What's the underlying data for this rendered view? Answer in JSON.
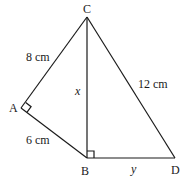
{
  "diagram": {
    "points": {
      "A": {
        "label": "A",
        "x": 21,
        "y": 108
      },
      "B": {
        "label": "B",
        "x": 87,
        "y": 158
      },
      "C": {
        "label": "C",
        "x": 87,
        "y": 17
      },
      "D": {
        "label": "D",
        "x": 175,
        "y": 158
      }
    },
    "segments": [
      {
        "from": "C",
        "to": "A",
        "label": "8 cm"
      },
      {
        "from": "A",
        "to": "B",
        "label": "6 cm"
      },
      {
        "from": "C",
        "to": "B",
        "label": "x"
      },
      {
        "from": "C",
        "to": "D",
        "label": "12 cm"
      },
      {
        "from": "B",
        "to": "D",
        "label": "y"
      }
    ],
    "right_angles": [
      "A",
      "B"
    ],
    "labels": {
      "pointA": "A",
      "pointB": "B",
      "pointC": "C",
      "pointD": "D",
      "CA": "8 cm",
      "AB": "6 cm",
      "CB": "x",
      "CD": "12 cm",
      "BD": "y"
    }
  }
}
